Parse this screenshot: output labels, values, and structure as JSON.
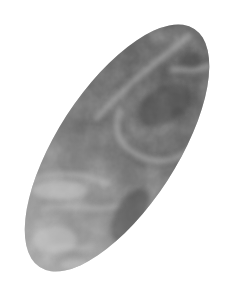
{
  "image": {
    "description": "Grayscale elliptical textured specimen (tilted ellipse) on white background",
    "background": "#ffffff",
    "colors": {
      "dark": "#4a4a4a",
      "mid": "#7a7a7a",
      "light": "#b8b8b8",
      "highlight": "#d6d6d6"
    }
  }
}
